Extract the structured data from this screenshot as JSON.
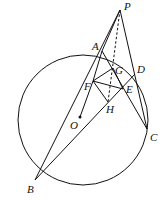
{
  "diagram": {
    "type": "geometry",
    "circle": {
      "center": "O",
      "cx": 83,
      "cy": 120,
      "r": 65
    },
    "points": {
      "P": {
        "x": 120,
        "y": 10,
        "label": "P"
      },
      "A": {
        "x": 102,
        "y": 51,
        "label": "A"
      },
      "D": {
        "x": 135,
        "y": 74,
        "label": "D"
      },
      "G": {
        "x": 113,
        "y": 68,
        "label": "G"
      },
      "F": {
        "x": 93,
        "y": 81,
        "label": "F"
      },
      "E": {
        "x": 123,
        "y": 89,
        "label": "E"
      },
      "H": {
        "x": 108,
        "y": 102,
        "label": "H"
      },
      "O": {
        "x": 80,
        "y": 117,
        "label": "O"
      },
      "C": {
        "x": 147,
        "y": 129,
        "label": "C"
      },
      "B": {
        "x": 35,
        "y": 180,
        "label": "B"
      }
    },
    "segments": [
      "PB",
      "PA",
      "PC",
      "AC",
      "BD",
      "FG",
      "GE",
      "EH",
      "HF",
      "FE",
      "FO"
    ],
    "dashed_segments": [
      "PH",
      "GH"
    ]
  }
}
